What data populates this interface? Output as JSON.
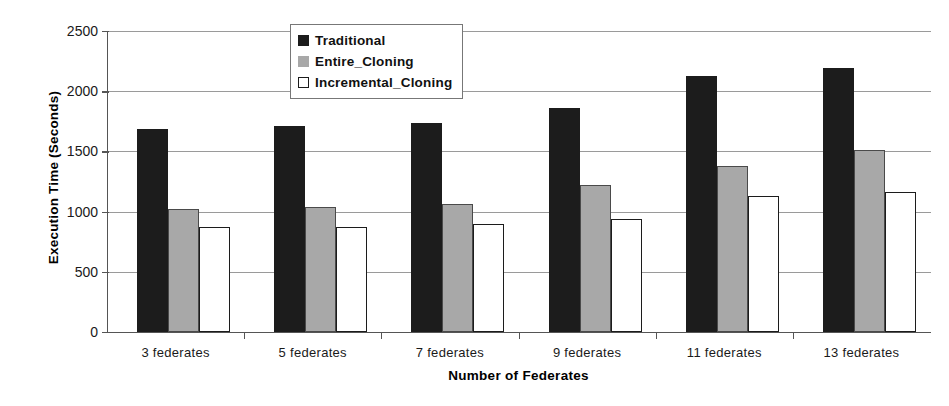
{
  "chart_data": {
    "type": "bar",
    "title": "",
    "xlabel": "Number of Federates",
    "ylabel": "Execution Time (Seconds)",
    "categories": [
      "3 federates",
      "5 federates",
      "7 federates",
      "9 federates",
      "11 federates",
      "13 federates"
    ],
    "series": [
      {
        "name": "Traditional",
        "color": "#1c1c1c",
        "values": [
          1690,
          1710,
          1735,
          1860,
          2130,
          2190
        ]
      },
      {
        "name": "Entire_Cloning",
        "color": "#a8a8a8",
        "values": [
          1020,
          1040,
          1065,
          1220,
          1380,
          1510
        ]
      },
      {
        "name": "Incremental_Cloning",
        "color": "#ffffff",
        "values": [
          875,
          875,
          895,
          940,
          1130,
          1165
        ]
      }
    ],
    "ylim": [
      0,
      2500
    ],
    "yticks": [
      0,
      500,
      1000,
      1500,
      2000,
      2500
    ],
    "ytick_labels": [
      "0",
      "500",
      "1000",
      "1500",
      "2000",
      "2500"
    ],
    "grid": true,
    "legend_position": "top-center-inside"
  },
  "legend": {
    "items": [
      {
        "label": "Traditional",
        "swatch": "filled-black-square-icon"
      },
      {
        "label": "Entire_Cloning",
        "swatch": "filled-gray-square-icon"
      },
      {
        "label": "Incremental_Cloning",
        "swatch": "outlined-white-square-icon"
      }
    ]
  }
}
